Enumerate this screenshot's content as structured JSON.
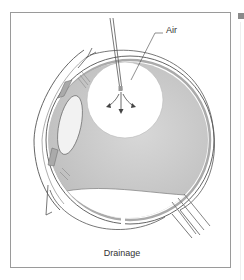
{
  "figure": {
    "labels": {
      "air": "Air",
      "caption": "Drainage"
    },
    "colors": {
      "vitreous_fill": "#c8c8c8",
      "outline": "#555555",
      "frame": "#9a9a9a",
      "air_bubble": "#ffffff"
    }
  }
}
